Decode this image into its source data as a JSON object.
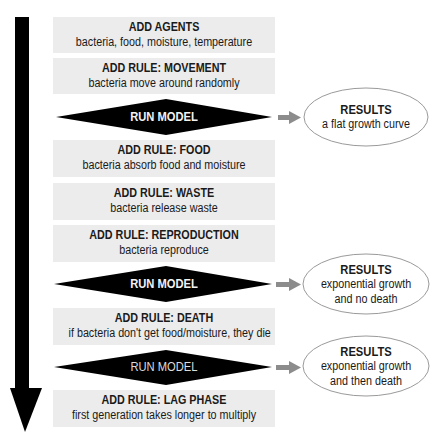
{
  "colors": {
    "box_bg": "#ececec",
    "diamond": "#000000",
    "arrow_main": "#000000",
    "connector_arrow": "#8c8c8c",
    "ellipse_stroke": "#9a9a9a"
  },
  "steps": [
    {
      "type": "box",
      "title": "ADD AGENTS",
      "subtitle": "bacteria, food, moisture, temperature"
    },
    {
      "type": "box",
      "title": "ADD RULE: MOVEMENT",
      "subtitle": "bacteria move around randomly"
    },
    {
      "type": "diamond",
      "label": "RUN MODEL"
    },
    {
      "type": "box",
      "title": "ADD RULE: FOOD",
      "subtitle": "bacteria absorb food and moisture"
    },
    {
      "type": "box",
      "title": "ADD RULE: WASTE",
      "subtitle": "bacteria release waste"
    },
    {
      "type": "box",
      "title": "ADD RULE: REPRODUCTION",
      "subtitle": "bacteria reproduce"
    },
    {
      "type": "diamond",
      "label": "RUN MODEL"
    },
    {
      "type": "box",
      "title": "ADD RULE: DEATH",
      "subtitle": "if bacteria don't get food/moisture, they die"
    },
    {
      "type": "diamond",
      "label": "RUN MODEL"
    },
    {
      "type": "box",
      "title": "ADD RULE: LAG PHASE",
      "subtitle": "first generation takes longer to multiply"
    }
  ],
  "results": [
    {
      "title": "RESULTS",
      "line1": "a flat growth curve",
      "line2": ""
    },
    {
      "title": "RESULTS",
      "line1": "exponential growth",
      "line2": "and no death"
    },
    {
      "title": "RESULTS",
      "line1": "exponential growth",
      "line2": "and then death"
    }
  ]
}
